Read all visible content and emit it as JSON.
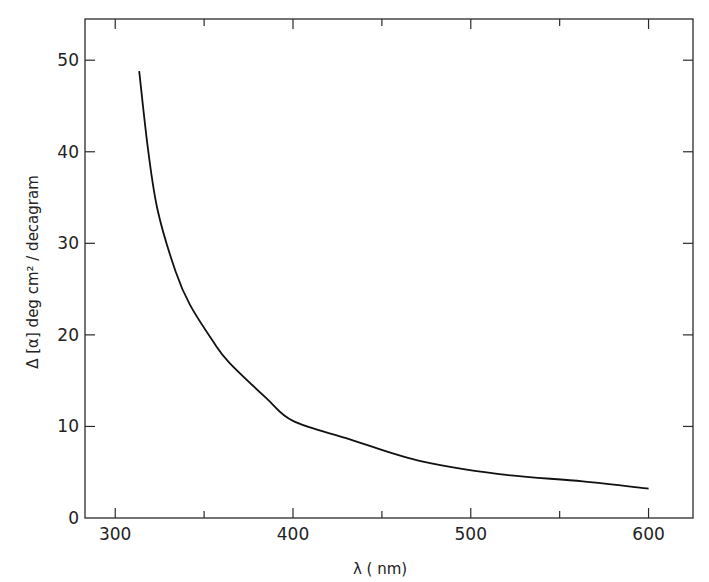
{
  "chart_data": {
    "type": "line",
    "title": "",
    "xlabel": "λ ( nm)",
    "ylabel": "Δ [α]  deg  cm² / decagram",
    "xlim": [
      283,
      625
    ],
    "ylim": [
      0,
      54.5
    ],
    "x_ticks": [
      300,
      400,
      500,
      600
    ],
    "x_tick_labels": [
      "300",
      "400",
      "500",
      "600"
    ],
    "x_minor_ticks": [
      350,
      450,
      550
    ],
    "y_ticks": [
      0,
      10,
      20,
      30,
      40,
      50
    ],
    "y_tick_labels": [
      "0",
      "10",
      "20",
      "30",
      "40",
      "50"
    ],
    "grid": false,
    "legend": null,
    "frame": "box with ticks on all four sides",
    "series": [
      {
        "name": "Δ[α]",
        "color": "#111111",
        "x": [
          313.5,
          318.5,
          324,
          334,
          342,
          355,
          364,
          385,
          400,
          432,
          470,
          516,
          563,
          600
        ],
        "y": [
          48.8,
          40.2,
          33.5,
          26.9,
          23.3,
          19.3,
          17.0,
          13.1,
          10.6,
          8.6,
          6.3,
          4.8,
          4.0,
          3.2
        ]
      }
    ]
  }
}
